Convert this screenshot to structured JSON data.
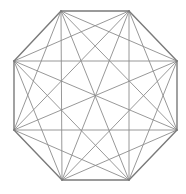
{
  "diagram": {
    "type": "complete-graph-octagon",
    "stroke_color": "#8c8c8c",
    "edge_color": "#7a7a7a",
    "background": "#ffffff",
    "vertices": [
      {
        "id": 0,
        "x": 61,
        "y": 11
      },
      {
        "id": 1,
        "x": 129,
        "y": 11
      },
      {
        "id": 2,
        "x": 177,
        "y": 61
      },
      {
        "id": 3,
        "x": 177,
        "y": 130
      },
      {
        "id": 4,
        "x": 129,
        "y": 180
      },
      {
        "id": 5,
        "x": 62,
        "y": 180
      },
      {
        "id": 6,
        "x": 14,
        "y": 130
      },
      {
        "id": 7,
        "x": 14,
        "y": 61
      }
    ]
  }
}
